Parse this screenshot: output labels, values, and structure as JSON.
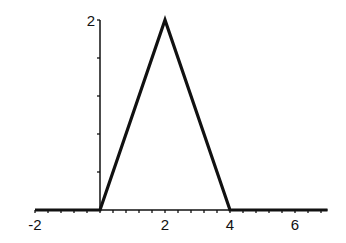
{
  "chart_data": {
    "type": "line",
    "title": "",
    "xlabel": "",
    "ylabel": "",
    "xlim": [
      -2,
      7
    ],
    "ylim": [
      0,
      2
    ],
    "grid": false,
    "legend": null,
    "x_ticks_labeled": [
      -2,
      2,
      4,
      6
    ],
    "x_tick_labels": [
      "-2",
      "2",
      "4",
      "6"
    ],
    "x_minor_tick_step": 0.4,
    "y_ticks_labeled": [
      2
    ],
    "y_tick_labels": [
      "2"
    ],
    "y_minor_tick_step": 0.4,
    "series": [
      {
        "name": "piecewise triangle",
        "x": [
          -2,
          0,
          2,
          4,
          7
        ],
        "y": [
          0,
          0,
          2,
          0,
          0
        ]
      }
    ],
    "line_color": "#111111"
  }
}
